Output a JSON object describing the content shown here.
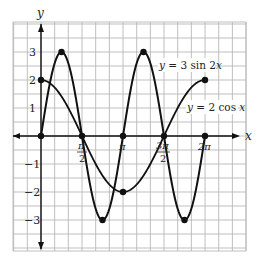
{
  "chart_data": {
    "type": "line",
    "title": "",
    "xlabel": "x",
    "ylabel": "y",
    "xlim": [
      -1.0472,
      7.33
    ],
    "ylim": [
      -4.1,
      4.1
    ],
    "grid": true,
    "x_ticks": [
      {
        "value": 1.5708,
        "label_num": "π",
        "label_den": "2"
      },
      {
        "value": 3.1416,
        "label": "π"
      },
      {
        "value": 4.7124,
        "label_num": "3π",
        "label_den": "2"
      },
      {
        "value": 6.2832,
        "label": "2π"
      }
    ],
    "y_ticks": [
      {
        "value": 3,
        "label": "3"
      },
      {
        "value": 2,
        "label": "2"
      },
      {
        "value": 1,
        "label": "1"
      },
      {
        "value": -1,
        "label": "−1"
      },
      {
        "value": -2,
        "label": "−2"
      },
      {
        "value": -3,
        "label": "−3"
      }
    ],
    "series": [
      {
        "name": "y = 3 sin 2x",
        "function": "3*sin(2*x)",
        "domain": [
          0,
          6.2832
        ],
        "points": [
          [
            0,
            0
          ],
          [
            0.7854,
            3
          ],
          [
            1.5708,
            0
          ],
          [
            2.3562,
            -3
          ],
          [
            3.1416,
            0
          ],
          [
            3.927,
            3
          ],
          [
            4.7124,
            0
          ],
          [
            5.4978,
            -3
          ],
          [
            6.2832,
            0
          ]
        ],
        "marked_points": [
          [
            0,
            0
          ],
          [
            0.7854,
            3
          ],
          [
            1.5708,
            0
          ],
          [
            2.3562,
            -3
          ],
          [
            3.1416,
            0
          ],
          [
            3.927,
            3
          ],
          [
            4.7124,
            0
          ],
          [
            5.4978,
            -3
          ],
          [
            6.2832,
            0
          ]
        ]
      },
      {
        "name": "y = 2 cos x",
        "function": "2*cos(x)",
        "domain": [
          0,
          6.2832
        ],
        "points": [
          [
            0,
            2
          ],
          [
            1.5708,
            0
          ],
          [
            3.1416,
            -2
          ],
          [
            4.7124,
            0
          ],
          [
            6.2832,
            2
          ]
        ],
        "marked_points": [
          [
            0,
            2
          ],
          [
            1.5708,
            0
          ],
          [
            3.1416,
            -2
          ],
          [
            4.7124,
            0
          ],
          [
            6.2832,
            2
          ]
        ]
      }
    ],
    "annotations": [
      {
        "text": "y = 3 sin 2x",
        "target_series": 0
      },
      {
        "text": "y = 2 cos x",
        "target_series": 1
      }
    ]
  },
  "labels": {
    "x_axis": "x",
    "y_axis": "y",
    "sin_label_y": "y",
    "sin_label_rest": " = 3 sin 2",
    "sin_label_x": "x",
    "cos_label_y": "y",
    "cos_label_rest": " = 2 cos ",
    "cos_label_x": "x",
    "tick_pi_half_num": "π",
    "tick_pi_half_den": "2",
    "tick_pi": "π",
    "tick_3pi_half_num": "3π",
    "tick_3pi_half_den": "2",
    "tick_2pi": "2π",
    "y3": "3",
    "y2": "2",
    "y1": "1",
    "ym1": "−1",
    "ym2": "−2",
    "ym3": "−3"
  },
  "colors": {
    "grid": "#b8b8b8",
    "curve": "#111111",
    "axis": "#111111"
  }
}
